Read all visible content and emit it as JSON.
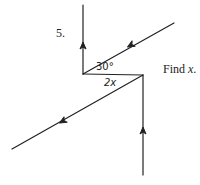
{
  "problem": {
    "number": "5.",
    "instruction_prefix": "Find ",
    "instruction_variable": "x",
    "instruction_suffix": "."
  },
  "angles": {
    "upper": "30°",
    "lower": "2x"
  },
  "colors": {
    "line": "#222222",
    "background": "#ffffff"
  },
  "geometry": {
    "left_vertical": {
      "x1": 83,
      "y1": 5,
      "x2": 83,
      "y2": 74
    },
    "top_diagonal": {
      "x1": 174,
      "y1": 23,
      "x2": 83,
      "y2": 74
    },
    "horizontal": {
      "x1": 83,
      "y1": 74,
      "x2": 143,
      "y2": 75
    },
    "bottom_diagonal": {
      "x1": 143,
      "y1": 75,
      "x2": 12,
      "y2": 149
    },
    "right_vertical": {
      "x1": 143,
      "y1": 175,
      "x2": 143,
      "y2": 75
    }
  }
}
